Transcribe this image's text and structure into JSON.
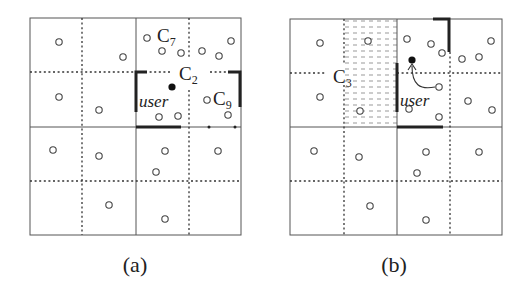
{
  "figure": {
    "panels": [
      {
        "id": "a",
        "caption": "(a)",
        "labels": {
          "c7": "C",
          "c7_sub": "7",
          "c2": "C",
          "c2_sub": "2",
          "c9": "C",
          "c9_sub": "9",
          "user": "user"
        }
      },
      {
        "id": "b",
        "caption": "(b)",
        "labels": {
          "c3": "C",
          "c3_sub": "3",
          "user": "user"
        }
      }
    ],
    "legend_semantics": {
      "open_circle": "data object",
      "filled_dot": "user location",
      "thick_segment": "cell boundary / safe region edge",
      "shaded_cells": "candidate region C3"
    }
  }
}
